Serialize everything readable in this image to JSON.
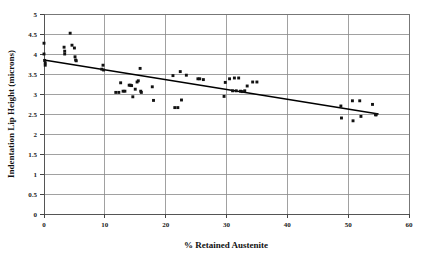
{
  "chart_data": {
    "type": "scatter",
    "title": "",
    "xlabel": "% Retained Austenite",
    "ylabel": "Indentation Lip Height (microns)",
    "xlim": [
      0,
      60
    ],
    "ylim": [
      0,
      5
    ],
    "xticks": [
      0,
      10,
      20,
      30,
      40,
      50,
      60
    ],
    "xtick_labels": [
      "0",
      "10",
      "20",
      "30",
      "40",
      "50",
      "60"
    ],
    "yticks": [
      0,
      0.5,
      1,
      1.5,
      2,
      2.5,
      3,
      3.5,
      4,
      4.5,
      5
    ],
    "ytick_labels": [
      "0",
      "0.5",
      "1",
      "1.5",
      "2",
      "2.5",
      "3",
      "3.5",
      "4",
      "4.5",
      "5"
    ],
    "grid": "horizontal-and-vertical",
    "legend": "none",
    "marker": "square",
    "marker_color": "#111111",
    "series": [
      {
        "name": "Indentation lip height vs retained austenite",
        "points": [
          [
            0.0,
            4.27
          ],
          [
            0.0,
            4.0
          ],
          [
            0.1,
            3.84
          ],
          [
            0.2,
            3.78
          ],
          [
            0.2,
            3.72
          ],
          [
            3.3,
            4.17
          ],
          [
            3.4,
            4.07
          ],
          [
            3.4,
            4.0
          ],
          [
            4.3,
            4.52
          ],
          [
            4.6,
            4.22
          ],
          [
            5.0,
            4.15
          ],
          [
            5.1,
            3.93
          ],
          [
            5.2,
            3.85
          ],
          [
            5.3,
            3.83
          ],
          [
            9.5,
            3.62
          ],
          [
            9.7,
            3.72
          ],
          [
            9.8,
            3.6
          ],
          [
            11.8,
            3.04
          ],
          [
            12.3,
            3.04
          ],
          [
            12.6,
            3.28
          ],
          [
            13.0,
            3.07
          ],
          [
            13.3,
            3.07
          ],
          [
            14.0,
            3.22
          ],
          [
            14.2,
            3.22
          ],
          [
            14.4,
            3.21
          ],
          [
            14.6,
            2.93
          ],
          [
            15.0,
            3.12
          ],
          [
            15.3,
            3.3
          ],
          [
            15.5,
            3.33
          ],
          [
            15.8,
            3.64
          ],
          [
            15.9,
            3.07
          ],
          [
            16.0,
            3.04
          ],
          [
            17.8,
            3.18
          ],
          [
            18.0,
            2.84
          ],
          [
            21.2,
            3.46
          ],
          [
            21.5,
            2.66
          ],
          [
            22.0,
            2.66
          ],
          [
            22.4,
            3.56
          ],
          [
            22.6,
            2.85
          ],
          [
            23.4,
            3.47
          ],
          [
            25.3,
            3.38
          ],
          [
            25.6,
            3.38
          ],
          [
            26.2,
            3.36
          ],
          [
            29.6,
            2.94
          ],
          [
            29.8,
            3.29
          ],
          [
            30.5,
            3.38
          ],
          [
            31.0,
            3.08
          ],
          [
            31.3,
            3.4
          ],
          [
            31.6,
            3.08
          ],
          [
            32.0,
            3.4
          ],
          [
            32.3,
            3.07
          ],
          [
            32.6,
            3.06
          ],
          [
            33.0,
            3.08
          ],
          [
            33.4,
            3.2
          ],
          [
            34.3,
            3.3
          ],
          [
            35.0,
            3.3
          ],
          [
            48.8,
            2.7
          ],
          [
            48.9,
            2.4
          ],
          [
            50.7,
            2.83
          ],
          [
            50.8,
            2.33
          ],
          [
            51.9,
            2.83
          ],
          [
            52.1,
            2.44
          ],
          [
            54.0,
            2.74
          ],
          [
            54.5,
            2.48
          ],
          [
            54.6,
            2.48
          ]
        ]
      }
    ],
    "trend_line": {
      "name": "linear-fit",
      "x_start": 0,
      "y_start": 3.85,
      "x_end": 55,
      "y_end": 2.5
    }
  }
}
